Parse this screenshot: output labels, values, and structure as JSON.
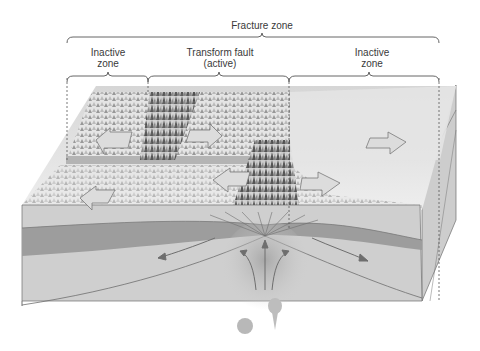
{
  "diagram": {
    "title": "Fracture zone",
    "labels": {
      "fracture_zone": "Fracture zone",
      "inactive_left_1": "Inactive",
      "inactive_left_2": "zone",
      "transform_1": "Transform fault",
      "transform_2": "(active)",
      "inactive_right_1": "Inactive",
      "inactive_right_2": "zone"
    },
    "elements": [
      "fracture-zone-bracket",
      "inactive-zone-left-bracket",
      "transform-fault-bracket",
      "inactive-zone-right-bracket",
      "plate-motion-arrows",
      "lithosphere-layer",
      "asthenosphere",
      "mantle-upwelling-arrows",
      "magma-blobs"
    ],
    "colors": {
      "surface": "#e2e2e2",
      "ridge_dark": "#5a5a5a",
      "lithosphere": "#9a9a9a",
      "asthenosphere": "#cfcfcf",
      "line": "#6e6e6e"
    }
  }
}
